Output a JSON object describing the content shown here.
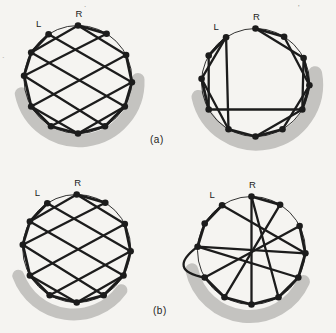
{
  "page": {
    "background": "#f5f4f1",
    "ink": "#1c1c1c",
    "shade_color": "#c4c3c0",
    "label_color": "#222222",
    "artifact_color": "#8f8f8a"
  },
  "captions": [
    {
      "id": "a",
      "text": "(a)",
      "x": 150,
      "y": 134
    },
    {
      "id": "b",
      "text": "(b)",
      "x": 153,
      "y": 305
    }
  ],
  "artifacts": [
    {
      "glyph": "'",
      "x": 298,
      "y": 10
    },
    {
      "glyph": "`",
      "x": 2,
      "y": 62
    },
    {
      "glyph": ".",
      "x": 84,
      "y": 7
    }
  ],
  "node_angles_deg": [
    90,
    58,
    27,
    -3,
    -30,
    -60,
    -90,
    -120,
    -150,
    176,
    150,
    123
  ],
  "node_radius": 3.3,
  "edge_width_chord": 2.3,
  "edge_width_rim": 2.8,
  "circle_stroke_width": 0.9,
  "graphs": [
    {
      "id": "a-left",
      "label_left": "L",
      "label_right": "R",
      "center": {
        "x": 78,
        "y": 79.5
      },
      "radius": 54,
      "shade": {
        "start_deg": -168,
        "end_deg": 2,
        "band_width": 13,
        "r_offset": 5,
        "dx": 1,
        "dy": 2
      },
      "edges": [
        [
          0,
          1
        ],
        [
          2,
          3
        ],
        [
          3,
          4
        ],
        [
          4,
          5
        ],
        [
          5,
          6
        ],
        [
          6,
          7
        ],
        [
          7,
          8
        ],
        [
          8,
          9
        ],
        [
          9,
          10
        ],
        [
          10,
          11
        ],
        [
          0,
          2
        ],
        [
          11,
          3
        ],
        [
          10,
          4
        ],
        [
          9,
          5
        ],
        [
          8,
          6
        ],
        [
          0,
          10
        ],
        [
          1,
          9
        ],
        [
          2,
          8
        ],
        [
          3,
          7
        ],
        [
          4,
          6
        ]
      ],
      "outside_edges": []
    },
    {
      "id": "a-right",
      "label_left": "L",
      "label_right": "R",
      "center": {
        "x": 255.5,
        "y": 82.5
      },
      "radius": 54,
      "shade": {
        "start_deg": -167,
        "end_deg": 10,
        "band_width": 14,
        "r_offset": 5.5,
        "dx": 1,
        "dy": 1
      },
      "edges": [
        [
          0,
          1
        ],
        [
          0,
          2
        ],
        [
          1,
          3
        ],
        [
          2,
          3
        ],
        [
          3,
          4
        ],
        [
          2,
          4
        ],
        [
          3,
          5
        ],
        [
          4,
          6
        ],
        [
          5,
          6
        ],
        [
          6,
          7
        ],
        [
          8,
          4
        ],
        [
          8,
          9
        ],
        [
          9,
          7
        ],
        [
          10,
          8
        ],
        [
          9,
          11
        ],
        [
          10,
          11
        ],
        [
          11,
          7
        ]
      ],
      "outside_edges": []
    },
    {
      "id": "b-left",
      "label_left": "L",
      "label_right": "R",
      "center": {
        "x": 76.7,
        "y": 248.5
      },
      "radius": 54,
      "shade": {
        "start_deg": -160,
        "end_deg": -36,
        "band_width": 12,
        "r_offset": 5,
        "dx": -3,
        "dy": 7
      },
      "edges": [
        [
          0,
          1
        ],
        [
          2,
          3
        ],
        [
          3,
          4
        ],
        [
          4,
          5
        ],
        [
          5,
          6
        ],
        [
          6,
          7
        ],
        [
          7,
          8
        ],
        [
          8,
          9
        ],
        [
          9,
          10
        ],
        [
          10,
          11
        ],
        [
          0,
          2
        ],
        [
          11,
          3
        ],
        [
          10,
          4
        ],
        [
          9,
          5
        ],
        [
          8,
          6
        ],
        [
          0,
          10
        ],
        [
          1,
          9
        ],
        [
          2,
          8
        ],
        [
          3,
          7
        ],
        [
          4,
          6
        ]
      ],
      "outside_edges": []
    },
    {
      "id": "b-right",
      "label_left": "L",
      "label_right": "R",
      "center": {
        "x": 251.5,
        "y": 250.5
      },
      "radius": 54,
      "shade": {
        "start_deg": -168,
        "end_deg": -24,
        "band_width": 13,
        "r_offset": 5,
        "dx": -2,
        "dy": 7
      },
      "edges": [
        [
          0,
          1
        ],
        [
          2,
          3
        ],
        [
          3,
          4
        ],
        [
          4,
          5
        ],
        [
          5,
          6
        ],
        [
          6,
          7
        ],
        [
          7,
          8
        ],
        [
          9,
          10
        ],
        [
          10,
          11
        ],
        [
          11,
          3
        ],
        [
          9,
          3
        ],
        [
          9,
          4
        ],
        [
          2,
          8
        ],
        [
          1,
          7
        ],
        [
          0,
          6
        ],
        [
          0,
          5
        ]
      ],
      "outside_edges": [
        {
          "nodes": [
            8,
            9
          ],
          "bulge_deg": -167,
          "bulge_factor": 1.62
        }
      ]
    }
  ]
}
